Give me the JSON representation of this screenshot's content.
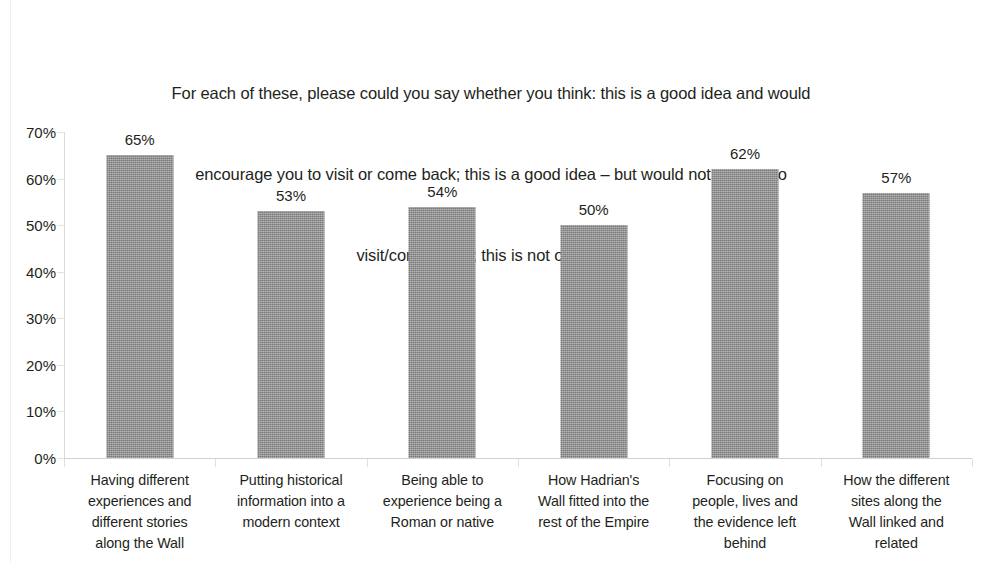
{
  "chart_data": {
    "type": "bar",
    "title_lines": [
      "For each of these, please could you say whether you think: this is a good idea and would",
      "encourage you to visit or come back; this is a good idea – but would not get you to",
      "visit/come  back; this is not of interest"
    ],
    "xlabel": "",
    "ylabel": "",
    "ylim": [
      0,
      70
    ],
    "ytick_step": 10,
    "ytick_labels": [
      "70%",
      "60%",
      "50%",
      "40%",
      "30%",
      "20%",
      "10%",
      "0%"
    ],
    "ytick_values": [
      70,
      60,
      50,
      40,
      30,
      20,
      10,
      0
    ],
    "grid": false,
    "legend": null,
    "bar_color": "#8a8a8a",
    "categories": [
      "Having different experiences and different stories along the Wall",
      "Putting historical information into a modern context",
      "Being able to experience being a Roman or native",
      "How Hadrian's Wall fitted into the rest of the Empire",
      "Focusing on people, lives and the evidence left behind",
      "How the different sites along the Wall linked and related"
    ],
    "category_lines": [
      [
        "Having different",
        "experiences and",
        "different stories",
        "along the Wall"
      ],
      [
        "Putting historical",
        "information into a",
        "modern context"
      ],
      [
        "Being able to",
        "experience being a",
        "Roman or native"
      ],
      [
        "How Hadrian's",
        "Wall fitted into the",
        "rest of the Empire"
      ],
      [
        "Focusing on",
        "people, lives and",
        "the evidence left",
        "behind"
      ],
      [
        "How the different",
        "sites along the",
        "Wall linked and",
        "related"
      ]
    ],
    "values": [
      65,
      53,
      54,
      50,
      62,
      57
    ],
    "value_labels": [
      "65%",
      "53%",
      "54%",
      "50%",
      "62%",
      "57%"
    ]
  }
}
